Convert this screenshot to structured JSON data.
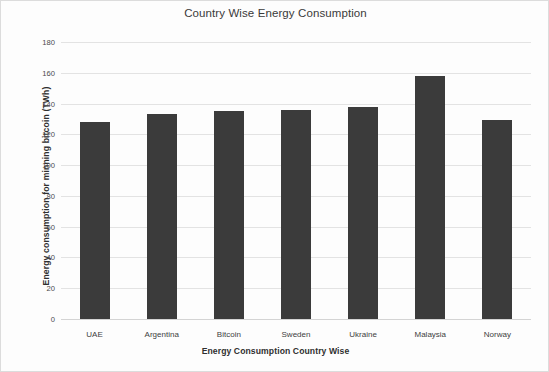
{
  "chart_data": {
    "type": "bar",
    "title": "Country Wise Energy Consumption",
    "xlabel": "Energy Consumption Country Wise",
    "ylabel": "Energy consumption for minning bitcoin (TWh)",
    "categories": [
      "UAE",
      "Argentina",
      "Bitcoin",
      "Sweden",
      "Ukraine",
      "Malaysia",
      "Norway"
    ],
    "values": [
      128,
      133,
      135,
      136,
      138,
      158,
      129
    ],
    "ylim": [
      0,
      180
    ],
    "ytick_labels": [
      "180",
      "160",
      "140",
      "120",
      "100",
      "80",
      "60",
      "40",
      "20",
      "0"
    ],
    "ytick_values": [
      180,
      160,
      140,
      120,
      100,
      80,
      60,
      40,
      20,
      0
    ],
    "ytick_step": 20,
    "grid": true,
    "legend": false,
    "bar_color": "#3b3b3b",
    "gridline_color": "#e3e3e3",
    "background_color": "#fdfdfd"
  }
}
